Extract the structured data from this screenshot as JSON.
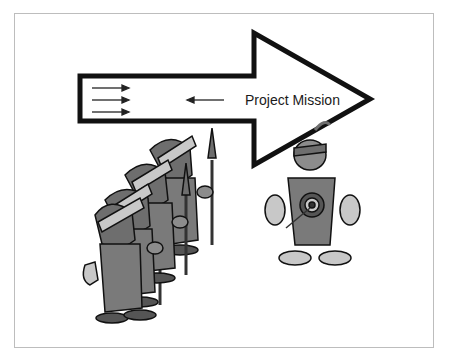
{
  "diagram": {
    "main_arrow": {
      "label": "Project Mission",
      "direction": "right",
      "color": "#111111",
      "fill": "#ffffff"
    },
    "flow_arrows": [
      {
        "direction": "right"
      },
      {
        "direction": "right"
      },
      {
        "direction": "right"
      },
      {
        "direction": "left"
      }
    ],
    "figures": [
      {
        "name": "soldiers-group",
        "description": "row of four helmeted soldiers holding spears, marching left",
        "count": 4
      },
      {
        "name": "target-person",
        "description": "figure with feather headband and bullseye target on chest, arrow near hand"
      }
    ],
    "colors": {
      "outline": "#111111",
      "figure_dark": "#6e6e6e",
      "figure_mid": "#8c8c8c",
      "figure_light": "#c8c8c8",
      "frame": "#bdbdbd"
    }
  }
}
